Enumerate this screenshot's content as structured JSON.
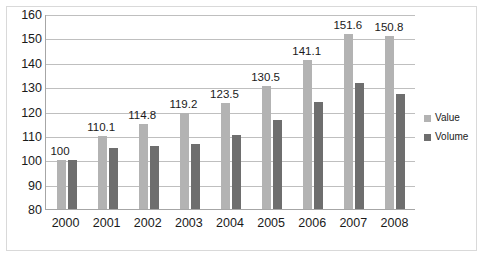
{
  "chart_data": {
    "type": "bar",
    "title": "2000–2008",
    "xlabel": "",
    "ylabel": "",
    "categories": [
      "2000",
      "2001",
      "2002",
      "2003",
      "2004",
      "2005",
      "2006",
      "2007",
      "2008"
    ],
    "series": [
      {
        "name": "Value",
        "color": "#b3b3b3",
        "values": [
          100,
          110.1,
          114.8,
          119.2,
          123.5,
          130.5,
          141.1,
          151.6,
          150.8
        ],
        "data_labels": [
          "100",
          "110.1",
          "114.8",
          "119.2",
          "123.5",
          "130.5",
          "141.1",
          "151.6",
          "150.8"
        ]
      },
      {
        "name": "Volume",
        "color": "#6e6e6e",
        "values": [
          100,
          105,
          106,
          106.5,
          110.5,
          116.5,
          124,
          131.5,
          127
        ],
        "data_labels": [
          "",
          "",
          "",
          "",
          "",
          "",
          "",
          "",
          ""
        ]
      }
    ],
    "ylim": [
      80,
      160
    ],
    "yticks": [
      80,
      90,
      100,
      110,
      120,
      130,
      140,
      150,
      160
    ],
    "ytick_labels": [
      "80",
      "90",
      "100",
      "110",
      "120",
      "130",
      "140",
      "150",
      "160"
    ],
    "grid": true,
    "legend_position": "right"
  },
  "legend": {
    "entries": [
      {
        "label": "Value",
        "swatch": "legend-swatch-value"
      },
      {
        "label": "Volume",
        "swatch": "legend-swatch-volume"
      }
    ]
  }
}
